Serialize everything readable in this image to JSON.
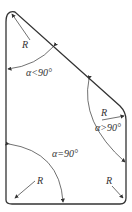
{
  "diagram": {
    "labels": {
      "r_top_left": "R",
      "angle_top_left": "α<90°",
      "r_right": "R",
      "angle_right": "α>90°",
      "angle_bottom_left": "α=90°",
      "r_bottom_left": "R",
      "r_bottom_right": "R"
    },
    "colors": {
      "stroke": "#333333",
      "background": "#ffffff"
    }
  }
}
